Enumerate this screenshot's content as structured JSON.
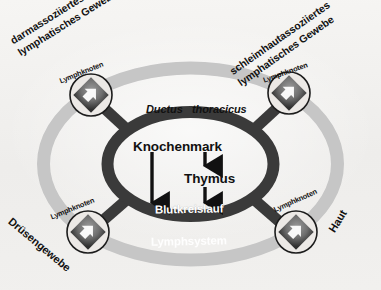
{
  "figure": {
    "title_visible": false,
    "background_color": "#f3f2f0",
    "ring_dark_color": "#3a3a3a",
    "ring_light_color": "#c6c6c6"
  },
  "center": {
    "ductus_word1": "Ductus",
    "ductus_word2": "thoracicus",
    "bone_marrow": "Knochenmark",
    "thymus": "Thymus",
    "bloodstream": "Blutkreislauf",
    "lymph_system": "Lymphsystem"
  },
  "nodes": [
    {
      "id": "top-left",
      "caption": "Lymphknoten"
    },
    {
      "id": "top-right",
      "caption": "Lymphknoten"
    },
    {
      "id": "bottom-left",
      "caption": "Lymphknoten"
    },
    {
      "id": "bottom-right",
      "caption": "Lymphknoten"
    }
  ],
  "tissue_labels": {
    "gut_line1": "darmassoziiertes",
    "gut_line2": "lymphatisches Gewebe",
    "mucosa_line1": "schleimhautassoziiertes",
    "mucosa_line2": "lymphatisches Gewebe",
    "gland": "Drüsengewebe",
    "skin": "Haut"
  },
  "arrows": {
    "ductus_down": "gray-arrow-down",
    "marrow_to_blood": "black-long-arrow-down",
    "marrow_to_thymus": "black-arrow-down",
    "thymus_to_blood": "black-arrow-down"
  }
}
